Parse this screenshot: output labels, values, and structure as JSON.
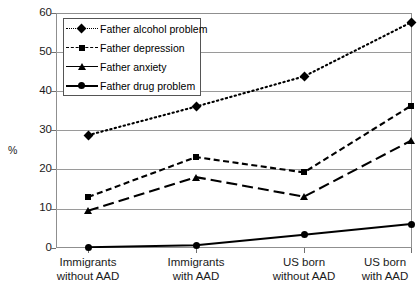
{
  "chart_data": {
    "type": "line",
    "title": "",
    "xlabel": "",
    "ylabel": "%",
    "ylim": [
      0,
      60
    ],
    "ytick_step": 10,
    "yticks": [
      "60",
      "50",
      "40",
      "30",
      "20",
      "10",
      "0"
    ],
    "grid": true,
    "legend_position": "top-left inside plot",
    "categories": [
      "Immigrants without AAD",
      "Immigrants with AAD",
      "US born without AAD",
      "US born with AAD"
    ],
    "category_lines": [
      [
        "Immigrants",
        "without AAD"
      ],
      [
        "Immigrants",
        "with AAD"
      ],
      [
        "US born",
        "without AAD"
      ],
      [
        "US born",
        "with AAD"
      ]
    ],
    "series": [
      {
        "name": "Father alcohol problem",
        "values": [
          28.8,
          36.1,
          43.8,
          57.6
        ],
        "marker": "diamond",
        "dash": "dotted",
        "color": "#000000"
      },
      {
        "name": "Father depression",
        "values": [
          13.0,
          23.2,
          19.3,
          36.3
        ],
        "marker": "square",
        "dash": "dashed",
        "color": "#000000"
      },
      {
        "name": "Father anxiety",
        "values": [
          9.5,
          18.1,
          13.1,
          27.4
        ],
        "marker": "triangle",
        "dash": "long-dash",
        "color": "#000000"
      },
      {
        "name": "Father drug problem",
        "values": [
          0.2,
          0.7,
          3.4,
          6.1
        ],
        "marker": "circle",
        "dash": "solid",
        "color": "#000000"
      }
    ]
  },
  "axis": {
    "percent_symbol": "%"
  },
  "caption": {
    "text": ""
  }
}
